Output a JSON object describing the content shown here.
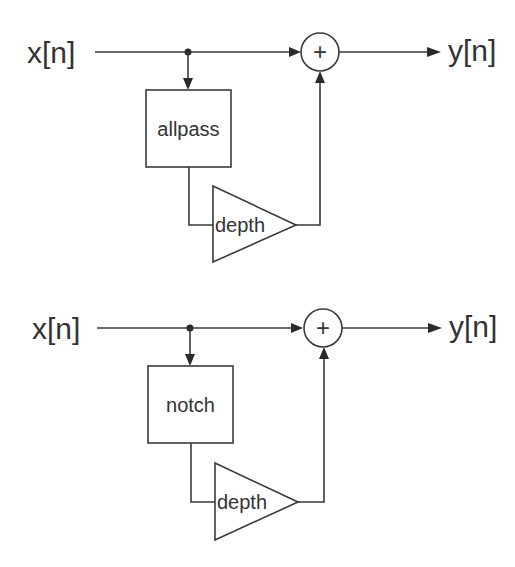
{
  "diagrams": [
    {
      "name": "allpass-flanger",
      "input_label": "x[n]",
      "output_label": "y[n]",
      "filter_label": "allpass",
      "gain_label": "depth",
      "summer_symbol": "+"
    },
    {
      "name": "notch-flanger",
      "input_label": "x[n]",
      "output_label": "y[n]",
      "filter_label": "notch",
      "gain_label": "depth",
      "summer_symbol": "+"
    }
  ]
}
